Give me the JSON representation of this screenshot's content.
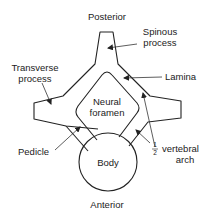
{
  "diagram": {
    "orientation": {
      "top": "Posterior",
      "bottom": "Anterior"
    },
    "labels": {
      "posterior": "Posterior",
      "anterior": "Anterior",
      "spinous_line1": "Spinous",
      "spinous_line2": "process",
      "transverse_line1": "Transverse",
      "transverse_line2": "process",
      "lamina": "Lamina",
      "neural_line1": "Neural",
      "neural_line2": "foramen",
      "pedicle": "Pedicle",
      "body": "Body",
      "half_num": "1",
      "half_den": "2",
      "vertebral_line1": "vertebral",
      "vertebral_line2": "arch"
    },
    "colors": {
      "stroke": "#222222",
      "background": "#ffffff"
    }
  }
}
